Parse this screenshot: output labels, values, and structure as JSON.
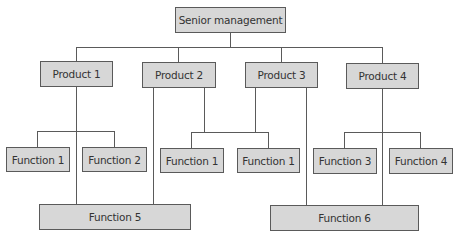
{
  "diagram": {
    "type": "org-chart",
    "root": {
      "label": "Senior management"
    },
    "products": [
      {
        "label": "Product 1"
      },
      {
        "label": "Product 2"
      },
      {
        "label": "Product 3"
      },
      {
        "label": "Product 4"
      }
    ],
    "functions": [
      {
        "label": "Function 1",
        "parent": "Product 1"
      },
      {
        "label": "Function 2",
        "parent": "Product 1"
      },
      {
        "label": "Function 1",
        "parent": "Product 2 / Product 3"
      },
      {
        "label": "Function 1",
        "parent": "Product 2 / Product 3"
      },
      {
        "label": "Function 3",
        "parent": "Product 4"
      },
      {
        "label": "Function 4",
        "parent": "Product 4"
      },
      {
        "label": "Function 5",
        "parent": "Product 1 / Product 2"
      },
      {
        "label": "Function 6",
        "parent": "Product 3 / Product 4"
      }
    ],
    "colors": {
      "box_fill": "#d7d7d7",
      "box_border": "#5a5a5a",
      "line": "#5a5a5a",
      "text": "#333333"
    }
  }
}
